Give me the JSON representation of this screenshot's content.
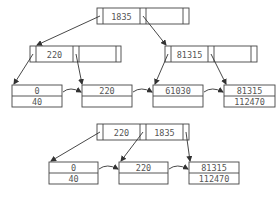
{
  "diagram": {
    "type": "B+ tree insertion / restructuring",
    "top_tree": {
      "root": {
        "keys": [
          "1835",
          ""
        ]
      },
      "internal": [
        {
          "keys": [
            "220",
            ""
          ]
        },
        {
          "keys": [
            "81315",
            ""
          ]
        }
      ],
      "leaves": [
        {
          "rows": [
            "0",
            "40"
          ]
        },
        {
          "rows": [
            "220",
            ""
          ]
        },
        {
          "rows": [
            "61030",
            ""
          ]
        },
        {
          "rows": [
            "81315",
            "112470"
          ]
        }
      ]
    },
    "bottom_tree": {
      "root": {
        "keys": [
          "220",
          "1835"
        ]
      },
      "leaves": [
        {
          "rows": [
            "0",
            "40"
          ]
        },
        {
          "rows": [
            "220",
            ""
          ]
        },
        {
          "rows": [
            "81315",
            "112470"
          ]
        }
      ]
    },
    "colors": {
      "line": "#444444",
      "text": "#555555",
      "background": "#ffffff"
    }
  }
}
